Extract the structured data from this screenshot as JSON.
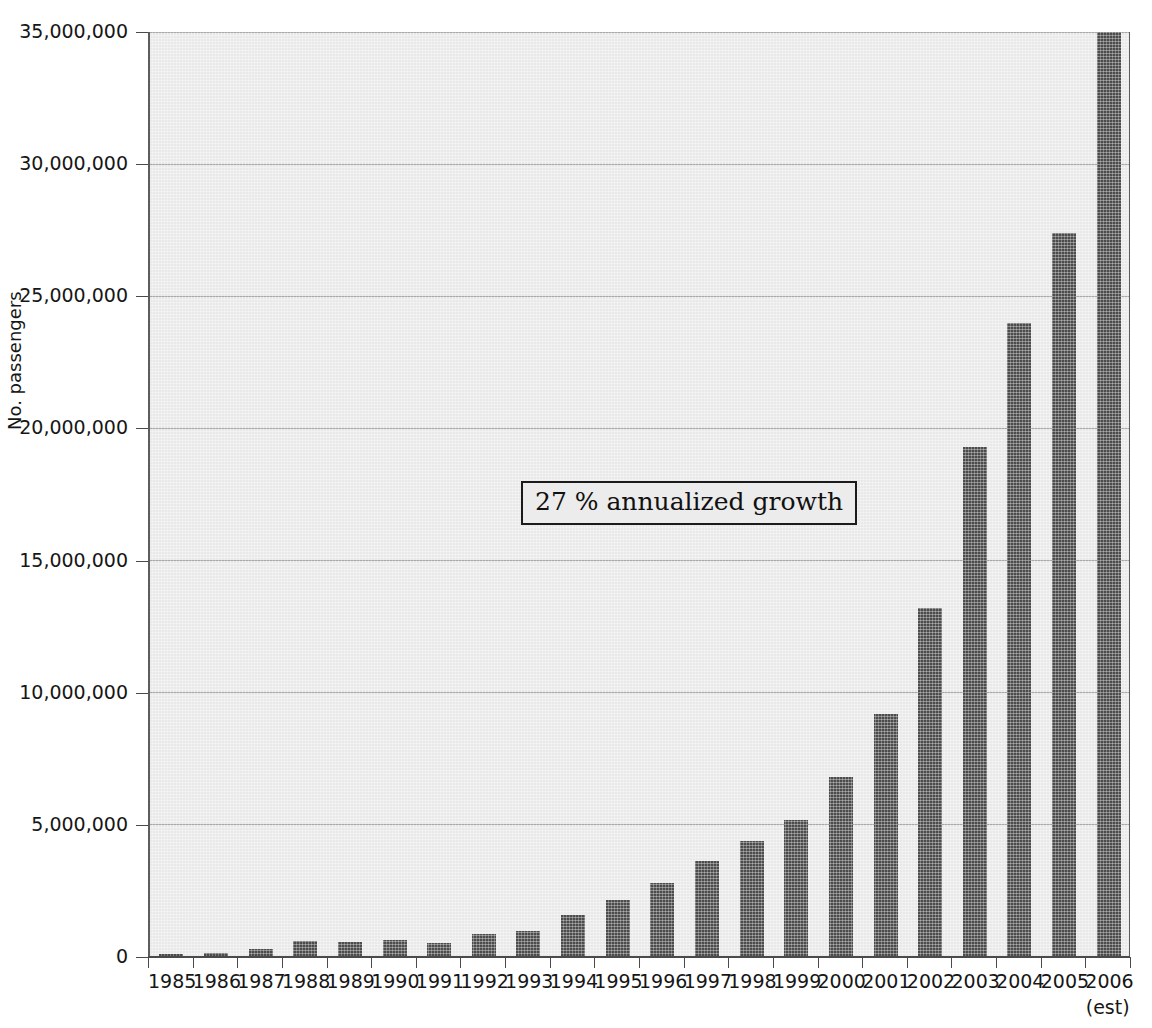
{
  "chart_data": {
    "type": "bar",
    "title": "",
    "xlabel": "",
    "ylabel": "No. passengers",
    "ylim": [
      0,
      35000000
    ],
    "ytick_labels": [
      "0",
      "5,000,000",
      "10,000,000",
      "15,000,000",
      "20,000,000",
      "25,000,000",
      "30,000,000",
      "35,000,000"
    ],
    "ytick_values": [
      0,
      5000000,
      10000000,
      15000000,
      20000000,
      25000000,
      30000000,
      35000000
    ],
    "grid": true,
    "legend": "none",
    "bar_color": "#4c4c4c",
    "plot_background": "#e9e9e9",
    "categories": [
      "1985",
      "1986",
      "1987",
      "1988",
      "1989",
      "1990",
      "1991",
      "1992",
      "1993",
      "1994",
      "1995",
      "1996",
      "1997",
      "1998",
      "1999",
      "2000",
      "2001",
      "2002",
      "2003",
      "2004",
      "2005",
      "2006"
    ],
    "values": [
      100000,
      150000,
      300000,
      600000,
      570000,
      650000,
      530000,
      880000,
      1000000,
      1600000,
      2150000,
      2800000,
      3650000,
      4400000,
      5200000,
      6800000,
      9200000,
      13200000,
      19300000,
      24000000,
      27400000,
      35000000
    ],
    "category_sublabels": [
      "",
      "",
      "",
      "",
      "",
      "",
      "",
      "",
      "",
      "",
      "",
      "",
      "",
      "",
      "",
      "",
      "",
      "",
      "",
      "",
      "",
      "(est)"
    ],
    "annotations": [
      {
        "text": "27 % annualized growth",
        "x_category": "1998",
        "y_value": 17500000
      }
    ]
  },
  "axis": {
    "y_title": "No. passengers"
  },
  "annotation": {
    "growth_text": "27 % annualized growth"
  },
  "x_sublabel": {
    "est": "(est)"
  }
}
